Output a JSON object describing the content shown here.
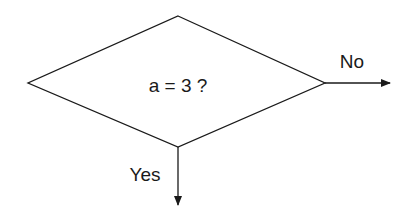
{
  "diagram": {
    "type": "flowchart-decision",
    "decision": {
      "label": "a = 3 ?"
    },
    "branches": [
      {
        "label": "No",
        "direction": "right"
      },
      {
        "label": "Yes",
        "direction": "down"
      }
    ],
    "colors": {
      "stroke": "#1a1a1a",
      "background": "#ffffff"
    }
  }
}
